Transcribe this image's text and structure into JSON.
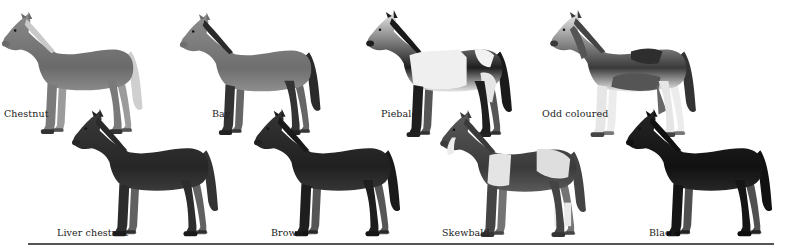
{
  "plate": {
    "title": "",
    "horses": [
      {
        "id": "chestnut",
        "label": "Chestnut",
        "x": 0,
        "y": 10,
        "w": 152,
        "h": 132,
        "body": "#8a8a8a",
        "dark": "#6a6a6a",
        "mane": "#c9c9c9",
        "tail": "#cfcfcf",
        "legs": "#7a7a7a",
        "hooves": "#333",
        "patches": [],
        "label_x": 4,
        "label_y": 108
      },
      {
        "id": "bay",
        "label": "Bay",
        "x": 178,
        "y": 12,
        "w": 152,
        "h": 130,
        "body": "#8e8e8e",
        "dark": "#6e6e6e",
        "mane": "#2a2a2a",
        "tail": "#2a2a2a",
        "legs": "#333",
        "hooves": "#222",
        "patches": [],
        "label_x": 212,
        "label_y": 108
      },
      {
        "id": "piebald",
        "label": "Piebald",
        "x": 364,
        "y": 12,
        "w": 158,
        "h": 130,
        "body": "#e8e8e8",
        "dark": "#1e1e1e",
        "mane": "#1a1a1a",
        "tail": "#1a1a1a",
        "legs": "#1e1e1e",
        "hooves": "#222",
        "patches": [
          "piebald"
        ],
        "label_x": 381,
        "label_y": 108
      },
      {
        "id": "odd_coloured",
        "label": "Odd coloured",
        "x": 548,
        "y": 12,
        "w": 158,
        "h": 130,
        "body": "#ececec",
        "dark": "#3a3a3a",
        "mane": "#444",
        "tail": "#333",
        "legs": "#e6e6e6",
        "hooves": "#444",
        "patches": [
          "odd"
        ],
        "label_x": 542,
        "label_y": 108
      },
      {
        "id": "liver_chestnut",
        "label": "Liver chestnut",
        "x": 70,
        "y": 110,
        "w": 158,
        "h": 132,
        "body": "#3a3a3a",
        "dark": "#262626",
        "mane": "#2a2a2a",
        "tail": "#333",
        "legs": "#2c2c2c",
        "hooves": "#1a1a1a",
        "patches": [],
        "label_x": 57,
        "label_y": 227
      },
      {
        "id": "brown",
        "label": "Brown",
        "x": 252,
        "y": 110,
        "w": 158,
        "h": 132,
        "body": "#353535",
        "dark": "#202020",
        "mane": "#1a1a1a",
        "tail": "#1a1a1a",
        "legs": "#1e1e1e",
        "hooves": "#151515",
        "patches": [],
        "label_x": 271,
        "label_y": 227
      },
      {
        "id": "skewbald",
        "label": "Skewbald",
        "x": 438,
        "y": 112,
        "w": 158,
        "h": 130,
        "body": "#5a5a5a",
        "dark": "#3a3a3a",
        "mane": "#3a3a3a",
        "tail": "#444",
        "legs": "#444",
        "hooves": "#333",
        "patches": [
          "skew"
        ],
        "label_x": 442,
        "label_y": 227
      },
      {
        "id": "black",
        "label": "Black",
        "x": 624,
        "y": 110,
        "w": 158,
        "h": 132,
        "body": "#262626",
        "dark": "#111",
        "mane": "#111",
        "tail": "#111",
        "legs": "#151515",
        "hooves": "#0e0e0e",
        "patches": [],
        "label_x": 649,
        "label_y": 227
      }
    ]
  }
}
